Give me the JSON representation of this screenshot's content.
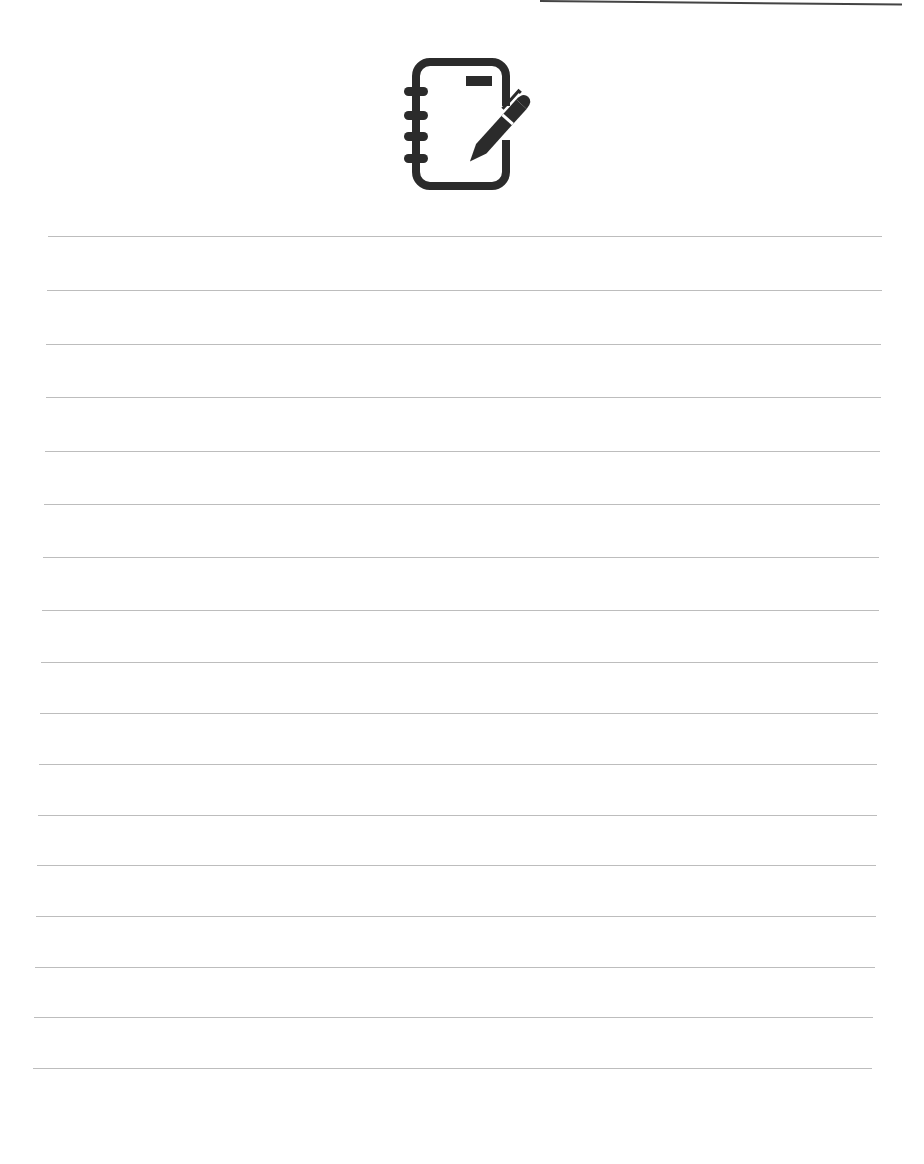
{
  "page": {
    "type": "lined-notepaper",
    "header_icon": "notebook-with-pen-icon",
    "line_count": 17,
    "line_color": "#bdbdbd",
    "icon_color": "#2b2b2b",
    "lines": [
      {
        "y": 236,
        "x1": 48,
        "x2": 882
      },
      {
        "y": 290,
        "x1": 47,
        "x2": 882
      },
      {
        "y": 344,
        "x1": 46,
        "x2": 881
      },
      {
        "y": 397,
        "x1": 46,
        "x2": 881
      },
      {
        "y": 451,
        "x1": 45,
        "x2": 880
      },
      {
        "y": 504,
        "x1": 44,
        "x2": 880
      },
      {
        "y": 557,
        "x1": 43,
        "x2": 879
      },
      {
        "y": 610,
        "x1": 42,
        "x2": 879
      },
      {
        "y": 662,
        "x1": 41,
        "x2": 878
      },
      {
        "y": 713,
        "x1": 40,
        "x2": 878
      },
      {
        "y": 764,
        "x1": 39,
        "x2": 877
      },
      {
        "y": 815,
        "x1": 38,
        "x2": 877
      },
      {
        "y": 865,
        "x1": 37,
        "x2": 876
      },
      {
        "y": 916,
        "x1": 36,
        "x2": 876
      },
      {
        "y": 967,
        "x1": 35,
        "x2": 875
      },
      {
        "y": 1017,
        "x1": 34,
        "x2": 873
      },
      {
        "y": 1068,
        "x1": 33,
        "x2": 872
      }
    ]
  }
}
